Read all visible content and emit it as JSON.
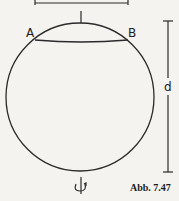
{
  "figure": {
    "labels": {
      "point_a": "A",
      "point_b": "B",
      "diameter": "d",
      "rotation_symbol": "↺"
    },
    "caption": "Abb. 7.47",
    "colors": {
      "stroke": "#2a2a2a",
      "background": "#f4f3ef"
    }
  }
}
